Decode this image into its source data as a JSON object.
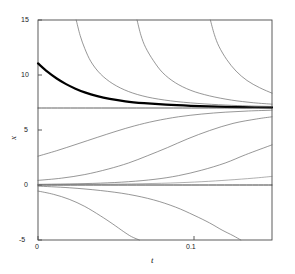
{
  "chart_data": {
    "type": "line",
    "title": "",
    "xlabel": "t",
    "ylabel": "x",
    "xlim": [
      0,
      0.15
    ],
    "ylim": [
      -5,
      15
    ],
    "grid": false,
    "legend": null,
    "x_ticks": [
      0,
      0.1
    ],
    "x_tick_labels": [
      "0",
      "0.1"
    ],
    "y_ticks": [
      -5,
      0,
      5,
      10,
      15
    ],
    "y_tick_labels": [
      "-5",
      "0",
      "5",
      "10",
      "15"
    ],
    "equilibria": [
      7,
      0
    ],
    "series": [
      {
        "name": "highlighted-solution",
        "style": "bold",
        "color": "#000000",
        "width": 2.2,
        "x": [
          0,
          0.006,
          0.012,
          0.018,
          0.024,
          0.03,
          0.038,
          0.046,
          0.056,
          0.068,
          0.082,
          0.098,
          0.115,
          0.132,
          0.15
        ],
        "y": [
          11.05,
          10.3,
          9.68,
          9.17,
          8.76,
          8.42,
          8.08,
          7.83,
          7.61,
          7.44,
          7.3,
          7.2,
          7.13,
          7.08,
          7.05
        ]
      },
      {
        "name": "equilibrium-line-7",
        "style": "thin",
        "color": "#3a3a3a",
        "width": 0.8,
        "x": [
          0,
          0.15
        ],
        "y": [
          7,
          7
        ]
      },
      {
        "name": "equilibrium-line-0",
        "style": "thin",
        "color": "#2a2a2a",
        "width": 0.9,
        "x": [
          0,
          0.15
        ],
        "y": [
          0,
          0
        ]
      },
      {
        "name": "decay-above-1",
        "style": "thin",
        "color": "#6a6a6a",
        "width": 0.7,
        "x": [
          0.0245,
          0.027,
          0.03,
          0.034,
          0.04,
          0.048,
          0.058,
          0.07,
          0.085,
          0.102,
          0.12,
          0.135,
          0.15
        ],
        "y": [
          15,
          13.6,
          12.4,
          11.2,
          10.1,
          9.2,
          8.5,
          8.0,
          7.65,
          7.42,
          7.27,
          7.19,
          7.14
        ]
      },
      {
        "name": "decay-above-2",
        "style": "thin",
        "color": "#6a6a6a",
        "width": 0.7,
        "x": [
          0.0635,
          0.066,
          0.069,
          0.074,
          0.08,
          0.088,
          0.098,
          0.11,
          0.124,
          0.138,
          0.15
        ],
        "y": [
          15,
          13.6,
          12.5,
          11.3,
          10.2,
          9.3,
          8.6,
          8.1,
          7.72,
          7.48,
          7.35
        ]
      },
      {
        "name": "decay-above-3",
        "style": "thin",
        "color": "#6a6a6a",
        "width": 0.7,
        "x": [
          0.1105,
          0.113,
          0.116,
          0.121,
          0.127,
          0.134,
          0.142,
          0.15
        ],
        "y": [
          15,
          13.7,
          12.6,
          11.4,
          10.35,
          9.5,
          8.85,
          8.35
        ]
      },
      {
        "name": "rising-sigmoid-1",
        "style": "thin",
        "color": "#6a6a6a",
        "width": 0.7,
        "x": [
          0,
          0.012,
          0.025,
          0.038,
          0.05,
          0.062,
          0.075,
          0.09,
          0.105,
          0.12,
          0.135,
          0.15
        ],
        "y": [
          2.62,
          3.12,
          3.72,
          4.33,
          4.88,
          5.38,
          5.82,
          6.2,
          6.45,
          6.62,
          6.73,
          6.8
        ]
      },
      {
        "name": "rising-sigmoid-2",
        "style": "thin",
        "color": "#6a6a6a",
        "width": 0.7,
        "x": [
          0,
          0.015,
          0.03,
          0.045,
          0.058,
          0.07,
          0.083,
          0.096,
          0.11,
          0.125,
          0.14,
          0.15
        ],
        "y": [
          0.42,
          0.62,
          0.95,
          1.45,
          2.0,
          2.65,
          3.4,
          4.2,
          4.95,
          5.6,
          6.0,
          6.2
        ]
      },
      {
        "name": "rising-sigmoid-3",
        "style": "thin",
        "color": "#6a6a6a",
        "width": 0.7,
        "x": [
          0,
          0.02,
          0.04,
          0.058,
          0.075,
          0.09,
          0.105,
          0.12,
          0.133,
          0.15
        ],
        "y": [
          0.06,
          0.1,
          0.17,
          0.3,
          0.52,
          0.85,
          1.35,
          2.0,
          2.75,
          3.65
        ]
      },
      {
        "name": "rising-shallow-4",
        "style": "thin",
        "color": "#7a7a7a",
        "width": 0.6,
        "x": [
          0,
          0.03,
          0.06,
          0.085,
          0.105,
          0.122,
          0.138,
          0.15
        ],
        "y": [
          0.02,
          0.05,
          0.1,
          0.18,
          0.3,
          0.45,
          0.62,
          0.78
        ]
      },
      {
        "name": "falling-below-1",
        "style": "thin",
        "color": "#6a6a6a",
        "width": 0.7,
        "x": [
          0,
          0.02,
          0.04,
          0.058,
          0.074,
          0.088,
          0.1,
          0.11,
          0.118,
          0.125,
          0.13
        ],
        "y": [
          -0.1,
          -0.25,
          -0.5,
          -0.85,
          -1.35,
          -2.0,
          -2.75,
          -3.45,
          -4.1,
          -4.6,
          -5.0
        ]
      },
      {
        "name": "falling-below-2",
        "style": "thin",
        "color": "#6a6a6a",
        "width": 0.7,
        "x": [
          0,
          0.01,
          0.02,
          0.03,
          0.04,
          0.048,
          0.055,
          0.06,
          0.065
        ],
        "y": [
          -0.55,
          -0.85,
          -1.3,
          -1.95,
          -2.8,
          -3.55,
          -4.25,
          -4.7,
          -5.0
        ]
      }
    ]
  },
  "axes": {
    "x_title": "t",
    "y_title": "x"
  }
}
